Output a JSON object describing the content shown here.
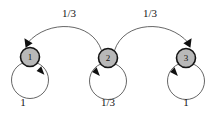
{
  "diagram": {
    "type": "markov-chain-state-diagram",
    "background_color": "#ffffff",
    "node_fill_color": "#b8b8b8",
    "node_stroke_color": "#141414",
    "edge_color": "#4a4a4a",
    "arrowhead_color": "#101010",
    "text_color": "#151515",
    "nodes": [
      {
        "id": "1",
        "label": "1",
        "cx": 30,
        "cy": 57,
        "r": 9.5
      },
      {
        "id": "2",
        "label": "2",
        "cx": 108,
        "cy": 58,
        "r": 9.5
      },
      {
        "id": "3",
        "label": "3",
        "cx": 186,
        "cy": 58,
        "r": 9.5
      }
    ],
    "self_loops": [
      {
        "node": "1",
        "label": "1",
        "label_x": 23,
        "label_y": 103
      },
      {
        "node": "2",
        "label": "1/3",
        "label_x": 108,
        "label_y": 103
      },
      {
        "node": "3",
        "label": "1",
        "label_x": 186,
        "label_y": 103
      }
    ],
    "arcs": [
      {
        "from": "2",
        "to": "1",
        "label": "1/3",
        "label_x": 69,
        "label_y": 14
      },
      {
        "from": "2",
        "to": "3",
        "label": "1/3",
        "label_x": 150,
        "label_y": 14
      }
    ]
  }
}
